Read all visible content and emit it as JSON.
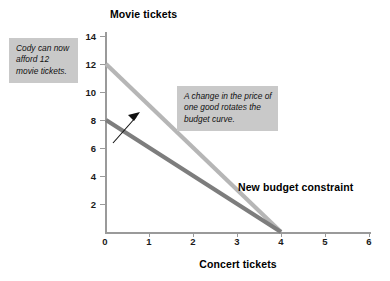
{
  "chart_data": {
    "type": "line",
    "title": "",
    "xlabel": "Concert tickets",
    "ylabel": "Movie tickets",
    "xlim": [
      0,
      6
    ],
    "ylim": [
      0,
      14
    ],
    "xticks": [
      "0",
      "1",
      "2",
      "3",
      "4",
      "5",
      "6"
    ],
    "yticks": [
      "0",
      "2",
      "4",
      "6",
      "8",
      "10",
      "12",
      "14"
    ],
    "grid": false,
    "legend": "inline-label",
    "series": [
      {
        "name": "New budget constraint",
        "color": "#b6b6b6",
        "x": [
          0,
          4
        ],
        "y": [
          12,
          0
        ],
        "x_intercept": 4,
        "y_intercept": 12
      },
      {
        "name": "Original budget constraint",
        "color": "#7d7d7d",
        "x": [
          0,
          4
        ],
        "y": [
          8,
          0
        ],
        "x_intercept": 4,
        "y_intercept": 8
      }
    ],
    "annotations": [
      {
        "id": "callout-left",
        "text": "Cody can now afford 12 movie tickets.",
        "style": "gray-box-italic"
      },
      {
        "id": "callout-right",
        "text": "A change in the price of one good rotates the budget curve.",
        "style": "gray-box-italic"
      },
      {
        "id": "series-label",
        "text": "New budget constraint",
        "style": "bold-inline"
      },
      {
        "id": "rotation-arrow",
        "text": "",
        "style": "black-arrow-up-right"
      }
    ]
  },
  "axes": {
    "y_title": "Movie tickets",
    "x_title": "Concert tickets",
    "y_ticks": [
      "14",
      "12",
      "10",
      "8",
      "6",
      "4",
      "2",
      "0"
    ],
    "x_ticks": [
      "0",
      "1",
      "2",
      "3",
      "4",
      "5",
      "6"
    ]
  },
  "callouts": {
    "left": "Cody can now afford 12 movie tickets.",
    "right": "A change in the price of one good rotates the budget curve."
  },
  "labels": {
    "new_budget_constraint": "New budget constraint"
  },
  "colors": {
    "new_line": "#b6b6b6",
    "old_line": "#7d7d7d",
    "axis": "#9a9a9a",
    "callout_bg": "#c9c9c9",
    "arrow": "#111111"
  }
}
